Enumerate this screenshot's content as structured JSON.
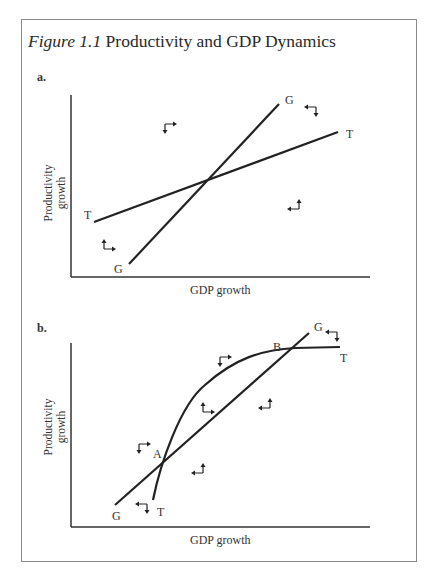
{
  "figure": {
    "number": "Figure 1.1",
    "title": "Productivity and GDP Dynamics"
  },
  "panels": [
    {
      "label": "a.",
      "xlabel": "GDP growth",
      "ylabel_line1": "Productivity",
      "ylabel_line2": "growth",
      "curves": [
        {
          "name": "T",
          "type": "line",
          "start_label": "T",
          "end_label": "T"
        },
        {
          "name": "G",
          "type": "line",
          "start_label": "G",
          "end_label": "G"
        }
      ],
      "direction_arrows": [
        {
          "region": "upper-left",
          "directions": [
            "right",
            "down"
          ]
        },
        {
          "region": "upper-right",
          "directions": [
            "left",
            "down"
          ]
        },
        {
          "region": "lower-right",
          "directions": [
            "left",
            "up"
          ]
        },
        {
          "region": "lower-left",
          "directions": [
            "right",
            "up"
          ]
        }
      ]
    },
    {
      "label": "b.",
      "xlabel": "GDP growth",
      "ylabel_line1": "Productivity",
      "ylabel_line2": "growth",
      "curves": [
        {
          "name": "G",
          "type": "line",
          "start_label": "G",
          "end_label": "G"
        },
        {
          "name": "T",
          "type": "concave curve",
          "start_label": "T",
          "end_label": "T"
        }
      ],
      "intersections": [
        {
          "label": "A"
        },
        {
          "label": "B"
        }
      ],
      "direction_arrows": [
        {
          "region": "left of A",
          "directions": [
            "right",
            "down"
          ]
        },
        {
          "region": "below A",
          "directions": [
            "left",
            "down"
          ]
        },
        {
          "region": "between curves upper",
          "directions": [
            "right",
            "down"
          ]
        },
        {
          "region": "between curves mid",
          "directions": [
            "right",
            "up"
          ]
        },
        {
          "region": "right of A lower",
          "directions": [
            "left",
            "up"
          ]
        },
        {
          "region": "right lower",
          "directions": [
            "left",
            "up"
          ]
        },
        {
          "region": "near B end",
          "directions": [
            "left",
            "down"
          ]
        }
      ]
    }
  ]
}
